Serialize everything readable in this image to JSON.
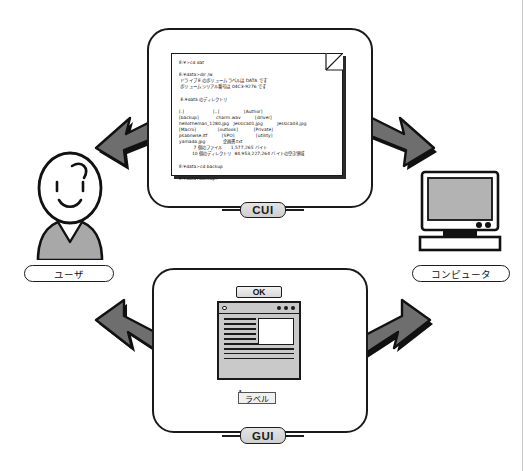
{
  "diagram": {
    "title_note": "CUI vs GUI interaction diagram",
    "actors": {
      "user": {
        "label": "ユーザ",
        "icon": "person-icon"
      },
      "computer": {
        "label": "コンピュータ",
        "icon": "crt-monitor-icon"
      }
    },
    "connectors": {
      "cui_label": "CUI",
      "gui_label": "GUI"
    },
    "cui_panel": {
      "document_lines": [
        "E:¥>cd dat",
        "",
        "E:¥data>dir /w",
        " ドライブ E のボリューム ラベルは DATA です",
        " ボリューム シリアル番号は 04C3-9276 です",
        "",
        " E:¥data のディレクトリ",
        "",
        "[.]                    [..]                 [Author]",
        "[backup]            charm.wav          [driver]",
        "hellotheman_1280.jpg   Jessica01.jpg          Jessica03.jpg",
        "[Macro]               [outlook]           [Private]",
        "psabnwse.itf          [SPO]               [utility]",
        "yamada.jpg            企画書.txt",
        "          7 個のファイル      1,577,265 バイト",
        "         10 個のディレクトリ  84,953,227,264 バイトの空き領域",
        "",
        "E:¥data>cd backup",
        "",
        "E:¥data¥backup>"
      ]
    },
    "gui_panel": {
      "ok_button_label": "OK",
      "label_chip_text": "ラベル",
      "window": {
        "title_bar_icon": "window-close-dot-icon",
        "title_bar_dots": 3
      }
    },
    "arrows": [
      {
        "name": "arrow-cui-to-user",
        "direction": "down-left"
      },
      {
        "name": "arrow-cui-to-computer",
        "direction": "down-right"
      },
      {
        "name": "arrow-gui-to-user",
        "direction": "up-left"
      },
      {
        "name": "arrow-gui-to-computer",
        "direction": "up-right"
      }
    ]
  }
}
